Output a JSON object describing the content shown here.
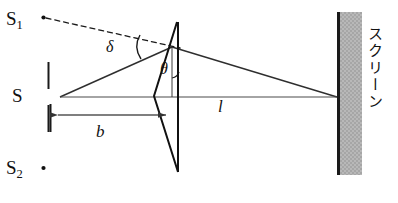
{
  "figure": {
    "kind": "optics-ray-diagram",
    "caption_text": "",
    "colors": {
      "ink": "#111111",
      "ray": "#2b2b2b",
      "dimension": "#555555",
      "screen_fill": "#b3b3b3",
      "screen_edge": "#1a1a1a",
      "background": "#ffffff"
    }
  },
  "labels": {
    "source_virtual_upper": "S",
    "source_virtual_upper_sub": "1",
    "source_virtual_lower": "S",
    "source_virtual_lower_sub": "2",
    "source_real": "S",
    "deviation_angle": "δ",
    "prism_angle": "θ",
    "distance_source_to_prism": "b",
    "distance_prism_to_screen": "l",
    "screen": "スクリーン"
  },
  "geometry": {
    "source_point": {
      "x": 60,
      "y": 97
    },
    "slit_top": {
      "x1": 48,
      "y1": 62,
      "x2": 48,
      "y2": 88
    },
    "slit_bottom": {
      "x1": 48,
      "y1": 106,
      "x2": 48,
      "y2": 132
    },
    "biprism_apex": {
      "x": 178,
      "y": 22
    },
    "biprism_bottom": {
      "x": 178,
      "y": 172
    },
    "biprism_left_mid": {
      "x": 155,
      "y": 97
    },
    "biprism_right_mid": {
      "x": 183,
      "y": 97
    },
    "prism_upper_deflect": {
      "x": 172,
      "y": 47
    },
    "screen_x": 337,
    "screen_top": 12,
    "screen_bottom": 175,
    "screen_width": 24,
    "converge_point": {
      "x": 337,
      "y": 97
    },
    "virtual_source_1": {
      "x": 43,
      "y": 18
    },
    "virtual_source_2": {
      "x": 43,
      "y": 168
    },
    "dimension_b": {
      "x1": 50,
      "x2": 173,
      "y": 115
    },
    "axis_line": {
      "x1": 60,
      "x2": 337,
      "y": 97
    }
  }
}
